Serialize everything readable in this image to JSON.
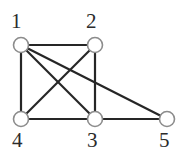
{
  "figure": {
    "background_color": "#ffffff",
    "width": 187,
    "height": 157
  },
  "style": {
    "edge_color": "#262626",
    "edge_width": 2.2,
    "node_fill": "#ffffff",
    "node_stroke": "#8c8c8c",
    "node_stroke_width": 1.6,
    "node_radius": 7.5,
    "label_color": "#2b2b2b",
    "label_font_size": 21
  },
  "chart_data": {
    "type": "diagram",
    "subtype": "node-link-graph",
    "title": "",
    "directed": false,
    "node_count": 5,
    "edge_count": 8,
    "nodes": [
      {
        "id": "1",
        "label": "1",
        "x": 21,
        "y": 45,
        "label_x": 11,
        "label_y": 11,
        "degree": 4
      },
      {
        "id": "2",
        "label": "2",
        "x": 95,
        "y": 45,
        "label_x": 86,
        "label_y": 11,
        "degree": 3
      },
      {
        "id": "3",
        "label": "3",
        "x": 95,
        "y": 119,
        "label_x": 87,
        "label_y": 130,
        "degree": 4
      },
      {
        "id": "4",
        "label": "4",
        "x": 21,
        "y": 119,
        "label_x": 12,
        "label_y": 130,
        "degree": 3
      },
      {
        "id": "5",
        "label": "5",
        "x": 167,
        "y": 119,
        "label_x": 159,
        "label_y": 130,
        "degree": 2
      }
    ],
    "edges": [
      {
        "source": "1",
        "target": "2"
      },
      {
        "source": "1",
        "target": "4"
      },
      {
        "source": "1",
        "target": "3"
      },
      {
        "source": "1",
        "target": "5"
      },
      {
        "source": "2",
        "target": "3"
      },
      {
        "source": "2",
        "target": "4"
      },
      {
        "source": "3",
        "target": "4"
      },
      {
        "source": "3",
        "target": "5"
      }
    ]
  }
}
